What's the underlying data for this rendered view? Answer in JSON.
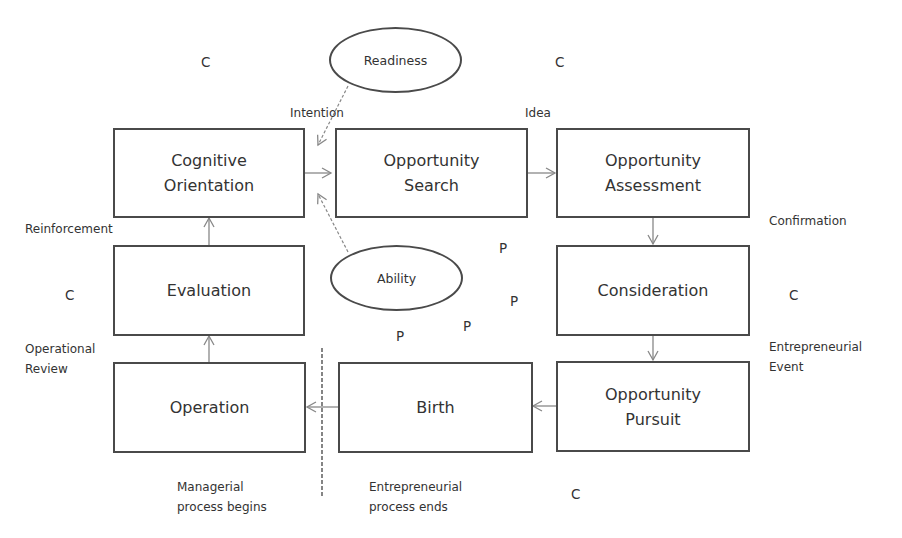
{
  "diagram": {
    "type": "process-flow",
    "boxes": {
      "cognitive_orientation": "Cognitive\nOrientation",
      "opportunity_search": "Opportunity\nSearch",
      "opportunity_assessment": "Opportunity\nAssessment",
      "evaluation": "Evaluation",
      "consideration": "Consideration",
      "operation": "Operation",
      "birth": "Birth",
      "opportunity_pursuit": "Opportunity\nPursuit"
    },
    "ellipses": {
      "readiness": "Readiness",
      "ability": "Ability"
    },
    "edge_labels": {
      "intention": "Intention",
      "idea": "Idea",
      "confirmation": "Confirmation",
      "entrepreneurial_event": "Entrepreneurial\nEvent",
      "reinforcement": "Reinforcement",
      "operational_review": "Operational\nReview"
    },
    "annotations": {
      "managerial_begins": "Managerial\nprocess begins",
      "entrepreneurial_ends": "Entrepreneurial\nprocess ends"
    },
    "markers": {
      "c_top_left": "C",
      "c_top_right": "C",
      "c_left": "C",
      "c_right": "C",
      "c_bottom": "C",
      "p1": "P",
      "p2": "P",
      "p3": "P",
      "p4": "P"
    },
    "edges": [
      {
        "from": "Cognitive Orientation",
        "to": "Opportunity Search",
        "style": "solid"
      },
      {
        "from": "Opportunity Search",
        "to": "Opportunity Assessment",
        "style": "solid",
        "label": "Idea"
      },
      {
        "from": "Opportunity Assessment",
        "to": "Consideration",
        "style": "solid",
        "label": "Confirmation"
      },
      {
        "from": "Consideration",
        "to": "Opportunity Pursuit",
        "style": "solid",
        "label": "Entrepreneurial Event"
      },
      {
        "from": "Opportunity Pursuit",
        "to": "Birth",
        "style": "solid"
      },
      {
        "from": "Birth",
        "to": "Operation",
        "style": "solid"
      },
      {
        "from": "Operation",
        "to": "Evaluation",
        "style": "solid",
        "label": "Operational Review"
      },
      {
        "from": "Evaluation",
        "to": "Cognitive Orientation",
        "style": "solid",
        "label": "Reinforcement"
      },
      {
        "from": "Readiness",
        "to": "Intention",
        "style": "dashed"
      },
      {
        "from": "Ability",
        "to": "Intention",
        "style": "dashed"
      }
    ],
    "colors": {
      "border": "#4a4a4a",
      "arrow": "#888888",
      "text": "#333333"
    }
  }
}
